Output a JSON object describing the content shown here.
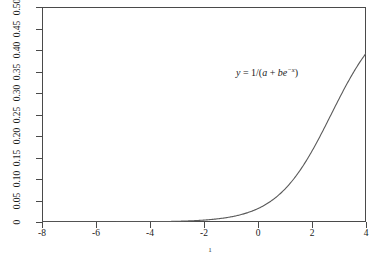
{
  "figure": {
    "caption": "1",
    "annotation": {
      "name": "equation-annotation",
      "lhs": "y",
      "eq": "=",
      "rhs_open": "1/(",
      "a": "a",
      "plus": "+",
      "b": "b",
      "e": "e",
      "exponent": "−x",
      "rhs_close": ")",
      "full_text": "y = 1/(a + be−x)",
      "x_data": -1.05,
      "y_data": 0.305
    }
  },
  "axes": {
    "x": {
      "label": "",
      "ticks": [
        -8,
        -6,
        -4,
        -2,
        0,
        2,
        4
      ],
      "tick_labels": [
        "-8",
        "-6",
        "-4",
        "-2",
        "0",
        "2",
        "4"
      ],
      "limits": [
        -8,
        4
      ]
    },
    "y": {
      "label": "",
      "ticks": [
        0,
        0.05,
        0.1,
        0.15,
        0.2,
        0.25,
        0.3,
        0.35,
        0.4,
        0.45,
        0.5
      ],
      "tick_labels": [
        "0",
        "0.05",
        "0.10",
        "0.15",
        "0.20",
        "0.25",
        "0.30",
        "0.35",
        "0.40",
        "0.45",
        "0.50"
      ],
      "limits": [
        0,
        0.5
      ],
      "label_rotation": -90
    }
  },
  "style": {
    "line_color": "#5a5a5a",
    "axis_color": "#4a4a4a",
    "text_color": "#1a1a1a",
    "background": "#ffffff"
  },
  "chart_data": {
    "type": "line",
    "title": "",
    "subtitle": "",
    "xlabel": "",
    "ylabel": "",
    "xlim": [
      -8,
      4
    ],
    "ylim": [
      0,
      0.5
    ],
    "grid": false,
    "legend": null,
    "annotations": [
      {
        "text": "y = 1/(a + be^-x)",
        "x": -1.05,
        "y": 0.305
      },
      {
        "text": "1",
        "x": null,
        "y": null,
        "role": "figure-number-caption"
      }
    ],
    "series": [
      {
        "name": "y = 1/(a + b*exp(-x))",
        "formula": "y = 1/(a + b*e^(-x))",
        "params": {
          "a": 2,
          "b": 30
        },
        "asymptote_upper": 0.5,
        "asymptote_lower": 0,
        "inflection_x": -2.708,
        "x": [
          -8.0,
          -7.5,
          -7.0,
          -6.5,
          -6.0,
          -5.5,
          -5.0,
          -4.5,
          -4.0,
          -3.5,
          -3.0,
          -2.5,
          -2.0,
          -1.5,
          -1.0,
          -0.5,
          0.0,
          0.5,
          1.0,
          1.5,
          2.0,
          2.5,
          3.0,
          3.5,
          4.0
        ],
        "y": [
          0.0111,
          0.018,
          0.0288,
          0.0453,
          0.0695,
          0.1033,
          0.1468,
          0.1972,
          0.2488,
          0.2954,
          0.3331,
          0.3611,
          0.3806,
          0.3935,
          0.4017,
          0.4068,
          0.41,
          0.4119,
          0.4131,
          0.4138,
          0.4143,
          0.4145,
          0.4147,
          0.4148,
          0.4148
        ]
      }
    ]
  }
}
